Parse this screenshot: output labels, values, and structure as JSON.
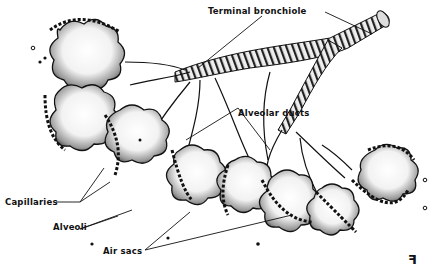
{
  "diagram": {
    "labels": {
      "terminal_bronchiole": "Terminal bronchiole",
      "alveolar_ducts": "Alveolar ducts",
      "capillaries": "Capillaries",
      "alveoli": "Alveoli",
      "air_sacs": "Air sacs"
    },
    "signature": "ꟻ",
    "colors": {
      "ink": "#111111",
      "background": "#ffffff",
      "stipple": "#555555"
    }
  }
}
